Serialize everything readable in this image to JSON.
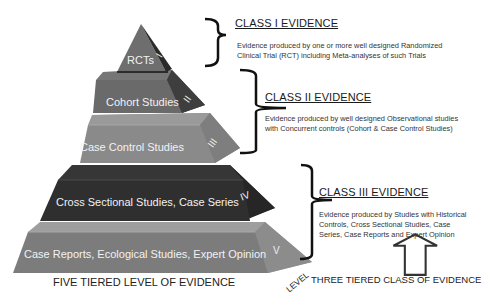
{
  "pyramid": {
    "caption": "FIVE TIERED LEVEL OF EVIDENCE",
    "axis_label": "LEVEL",
    "tiers": [
      {
        "level": "I",
        "label": "RCTs",
        "color": "#6e6e6e",
        "side_color": "#2e2e2e"
      },
      {
        "level": "II",
        "label": "Cohort Studies",
        "color": "#6a6a6a",
        "side_color": "#3c3c3c"
      },
      {
        "level": "III",
        "label": "Case Control Studies",
        "color": "#8a8a8a",
        "side_color": "#7a7a7a"
      },
      {
        "level": "IV",
        "label": "Cross Sectional Studies, Case Series",
        "color": "#2f2f2f",
        "side_color": "#252525"
      },
      {
        "level": "V",
        "label": "Case Reports, Ecological Studies, Expert Opinion",
        "color": "#7c7c7c",
        "side_color": "#8c8c8c"
      }
    ]
  },
  "classes": [
    {
      "title": "CLASS I EVIDENCE",
      "description_lines": [
        "Evidence produced by one or more well designed Randomized",
        "Clinical Trial (RCT) including Meta-analyses of such Trials"
      ]
    },
    {
      "title": "CLASS II EVIDENCE",
      "description_lines": [
        "Evidence produced by well designed Observational studies",
        "with Concurrent controls (Cohort & Case Control Studies)"
      ]
    },
    {
      "title": "CLASS III EVIDENCE",
      "description_lines": [
        "Evidence produced by Studies with Historical",
        "Controls, Cross Sectional Studies, Case",
        "Series, Case Reports and Expert Opinion"
      ]
    }
  ],
  "class_caption": "THREE TIERED CLASS OF EVIDENCE",
  "arrow_icon": "up-arrow-outline"
}
